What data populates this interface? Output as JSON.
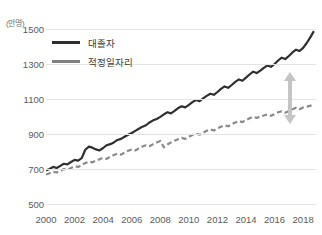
{
  "chart_data": {
    "type": "line",
    "title": "",
    "xlabel": "",
    "ylabel": "",
    "unit_label": "(만명)",
    "ylim": [
      500,
      1540
    ],
    "xlim": [
      2000,
      2018.9
    ],
    "y_ticks": [
      1500,
      1300,
      1100,
      900,
      700,
      500
    ],
    "x_ticks": [
      2000,
      2002,
      2004,
      2006,
      2008,
      2010,
      2012,
      2014,
      2016,
      2018
    ],
    "grid": true,
    "legend_position": "top-left",
    "series": [
      {
        "name": "대졸자",
        "style": "solid",
        "color": "#2f2f2f",
        "x": [
          2000.0,
          2000.25,
          2000.5,
          2000.75,
          2001.0,
          2001.25,
          2001.5,
          2001.75,
          2002.0,
          2002.25,
          2002.5,
          2002.75,
          2003.0,
          2003.25,
          2003.5,
          2003.75,
          2004.0,
          2004.25,
          2004.5,
          2004.75,
          2005.0,
          2005.25,
          2005.5,
          2005.75,
          2006.0,
          2006.25,
          2006.5,
          2006.75,
          2007.0,
          2007.25,
          2007.5,
          2007.75,
          2008.0,
          2008.25,
          2008.5,
          2008.75,
          2009.0,
          2009.25,
          2009.5,
          2009.75,
          2010.0,
          2010.25,
          2010.5,
          2010.75,
          2011.0,
          2011.25,
          2011.5,
          2011.75,
          2012.0,
          2012.25,
          2012.5,
          2012.75,
          2013.0,
          2013.25,
          2013.5,
          2013.75,
          2014.0,
          2014.25,
          2014.5,
          2014.75,
          2015.0,
          2015.25,
          2015.5,
          2015.75,
          2016.0,
          2016.25,
          2016.5,
          2016.75,
          2017.0,
          2017.25,
          2017.5,
          2017.75,
          2018.0,
          2018.25,
          2018.5,
          2018.75
        ],
        "values": [
          692,
          700,
          712,
          706,
          718,
          730,
          726,
          740,
          752,
          748,
          762,
          810,
          828,
          822,
          812,
          806,
          820,
          836,
          842,
          852,
          866,
          872,
          884,
          896,
          906,
          918,
          930,
          942,
          950,
          966,
          978,
          986,
          998,
          1012,
          1024,
          1018,
          1032,
          1048,
          1058,
          1052,
          1066,
          1082,
          1094,
          1088,
          1104,
          1118,
          1130,
          1124,
          1140,
          1158,
          1172,
          1164,
          1180,
          1198,
          1212,
          1204,
          1222,
          1240,
          1256,
          1248,
          1262,
          1278,
          1292,
          1284,
          1300,
          1320,
          1336,
          1328,
          1346,
          1366,
          1382,
          1374,
          1392,
          1420,
          1452,
          1488
        ]
      },
      {
        "name": "적정일자리",
        "style": "dashed",
        "color": "#8a8a8a",
        "x": [
          2000.0,
          2000.25,
          2000.5,
          2000.75,
          2001.0,
          2001.25,
          2001.5,
          2001.75,
          2002.0,
          2002.25,
          2002.5,
          2002.75,
          2003.0,
          2003.25,
          2003.5,
          2003.75,
          2004.0,
          2004.25,
          2004.5,
          2004.75,
          2005.0,
          2005.25,
          2005.5,
          2005.75,
          2006.0,
          2006.25,
          2006.5,
          2006.75,
          2007.0,
          2007.25,
          2007.5,
          2007.75,
          2008.0,
          2008.25,
          2008.5,
          2008.75,
          2009.0,
          2009.25,
          2009.5,
          2009.75,
          2010.0,
          2010.25,
          2010.5,
          2010.75,
          2011.0,
          2011.25,
          2011.5,
          2011.75,
          2012.0,
          2012.25,
          2012.5,
          2012.75,
          2013.0,
          2013.25,
          2013.5,
          2013.75,
          2014.0,
          2014.25,
          2014.5,
          2014.75,
          2015.0,
          2015.25,
          2015.5,
          2015.75,
          2016.0,
          2016.25,
          2016.5,
          2016.75,
          2017.0,
          2017.25,
          2017.5,
          2017.75,
          2018.0,
          2018.25,
          2018.5,
          2018.75
        ],
        "values": [
          668,
          676,
          684,
          680,
          690,
          700,
          696,
          706,
          716,
          712,
          722,
          734,
          742,
          738,
          748,
          756,
          764,
          758,
          770,
          780,
          788,
          782,
          794,
          804,
          812,
          806,
          818,
          828,
          836,
          830,
          842,
          852,
          860,
          824,
          840,
          852,
          862,
          870,
          878,
          872,
          884,
          894,
          902,
          896,
          908,
          918,
          926,
          920,
          932,
          942,
          950,
          944,
          956,
          966,
          974,
          968,
          980,
          990,
          998,
          992,
          1000,
          1006,
          1012,
          1004,
          1014,
          1024,
          1030,
          1022,
          1032,
          1042,
          1050,
          1042,
          1052,
          1056,
          1062,
          1058
        ]
      }
    ],
    "annotations": [
      {
        "name": "gap-arrow",
        "type": "double-headed-vertical-arrow",
        "color": "#c4c4c4",
        "description": "gap between 대졸자 and 적정일자리 near 2018"
      }
    ]
  }
}
